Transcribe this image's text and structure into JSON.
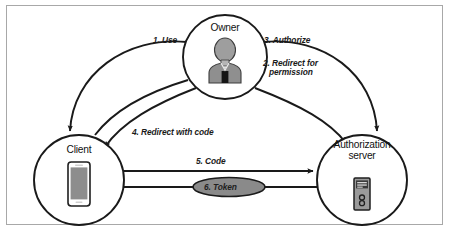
{
  "figure": {
    "background": "#ffffff",
    "frame_color": "#a8a8a8"
  },
  "colors": {
    "stroke": "#1a1a1a",
    "node_fill": "#ffffff",
    "token_ellipse_fill": "#8a8a8a",
    "avatar_gray": "#9e9e9e",
    "avatar_dark": "#6f6f6f",
    "device_gray": "#8d8d8d",
    "text": "#111111"
  },
  "nodes": [
    {
      "id": "owner",
      "label": "Owner",
      "icon": "person-avatar-icon",
      "cx": 225,
      "cy": 57,
      "r": 42
    },
    {
      "id": "client",
      "label": "Client",
      "icon": "mobile-phone-icon",
      "cx": 79,
      "cy": 180,
      "r": 45
    },
    {
      "id": "authorization-server",
      "label": "Authorization server",
      "label_line1": "Authorization",
      "label_line2": "server",
      "icon": "server-tower-icon",
      "cx": 362,
      "cy": 180,
      "r": 45
    }
  ],
  "edges": [
    {
      "id": "step-1",
      "label": "1. Use",
      "from": "owner",
      "to": "client",
      "number": 1
    },
    {
      "id": "step-2",
      "label_line1": "2. Redirect for",
      "label_line2": "permission",
      "label": "2. Redirect for permission",
      "from": "owner",
      "to": "authorization-server",
      "number": 2
    },
    {
      "id": "step-3",
      "label": "3. Authorize",
      "from": "owner",
      "to": "authorization-server",
      "number": 3
    },
    {
      "id": "step-4",
      "label": "4. Redirect with code",
      "from": "authorization-server",
      "to": "client",
      "number": 4
    },
    {
      "id": "step-5",
      "label": "5. Code",
      "from": "client",
      "to": "authorization-server",
      "number": 5
    },
    {
      "id": "step-6",
      "label": "6. Token",
      "from": "authorization-server",
      "to": "client",
      "number": 6,
      "badge": "ellipse"
    }
  ]
}
